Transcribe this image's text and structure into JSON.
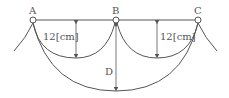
{
  "diagram": {
    "supports": [
      {
        "label": "A",
        "x": 33,
        "y": 20
      },
      {
        "label": "B",
        "x": 116,
        "y": 20
      },
      {
        "label": "C",
        "x": 198,
        "y": 20
      }
    ],
    "sag_labels": {
      "left": "12[cm]",
      "right": "12[cm]",
      "total": "D"
    },
    "colors": {
      "line": "#555555",
      "text": "#555555"
    }
  }
}
